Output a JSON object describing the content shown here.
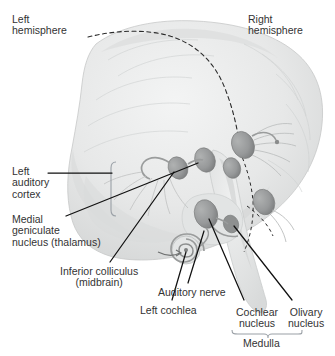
{
  "diagram": {
    "view": "three-quarter posterior view of brain with brainstem",
    "colors": {
      "background": "#ffffff",
      "brain_fill": "#e9eaea",
      "brain_shade": "#d5d7d7",
      "nucleus_fill": "#9a9c9c",
      "nucleus_dark": "#848686",
      "leader_line": "#111111",
      "midline_dashed": "#2b2b2b",
      "text": "#333333",
      "brace": "#9aa0a6"
    },
    "labels": [
      {
        "id": "left-hemisphere",
        "text": "Left\nhemisphere",
        "x": 12,
        "y": 14,
        "align": "left"
      },
      {
        "id": "right-hemisphere",
        "text": "Right\nhemisphere",
        "x": 248,
        "y": 14,
        "align": "left"
      },
      {
        "id": "left-auditory-cortex",
        "text": "Left\nauditory\ncortex",
        "x": 12,
        "y": 166,
        "align": "left"
      },
      {
        "id": "medial-geniculate",
        "text": "Medial\ngeniculate\nnucleus (thalamus)",
        "x": 12,
        "y": 214,
        "align": "left"
      },
      {
        "id": "inferior-colliculus",
        "text": "Inferior colliculus\n(midbrain)",
        "x": 60,
        "y": 266,
        "align": "center"
      },
      {
        "id": "auditory-nerve",
        "text": "Auditory nerve",
        "x": 158,
        "y": 287,
        "align": "left"
      },
      {
        "id": "left-cochlea",
        "text": "Left cochlea",
        "x": 140,
        "y": 305,
        "align": "left"
      },
      {
        "id": "cochlear-nucleus",
        "text": "Cochlear\nnucleus",
        "x": 236,
        "y": 307,
        "align": "center"
      },
      {
        "id": "olivary-nucleus",
        "text": "Olivary\nnucleus",
        "x": 288,
        "y": 307,
        "align": "center"
      },
      {
        "id": "medulla",
        "text": "Medulla",
        "x": 267,
        "y": 338,
        "align": "center"
      }
    ],
    "structures": [
      {
        "id": "left-medial-geniculate-nucleus",
        "side": "left",
        "kind": "nucleus"
      },
      {
        "id": "left-inferior-colliculus",
        "side": "left",
        "kind": "nucleus"
      },
      {
        "id": "left-cochlear-nucleus",
        "side": "left",
        "kind": "nucleus"
      },
      {
        "id": "left-olivary-nucleus",
        "side": "left",
        "kind": "nucleus"
      },
      {
        "id": "right-medial-geniculate-nucleus",
        "side": "right",
        "kind": "nucleus"
      },
      {
        "id": "right-inferior-colliculus",
        "side": "right",
        "kind": "nucleus"
      },
      {
        "id": "right-cochlear-nucleus",
        "side": "right",
        "kind": "nucleus"
      },
      {
        "id": "cochlea-spiral",
        "side": "left",
        "kind": "cochlea"
      },
      {
        "id": "midline-dashed-path",
        "side": "center",
        "kind": "pathway"
      },
      {
        "id": "auditory-cortex-bracket",
        "side": "left",
        "kind": "bracket"
      },
      {
        "id": "medulla-brace",
        "side": "right",
        "kind": "brace"
      }
    ]
  }
}
